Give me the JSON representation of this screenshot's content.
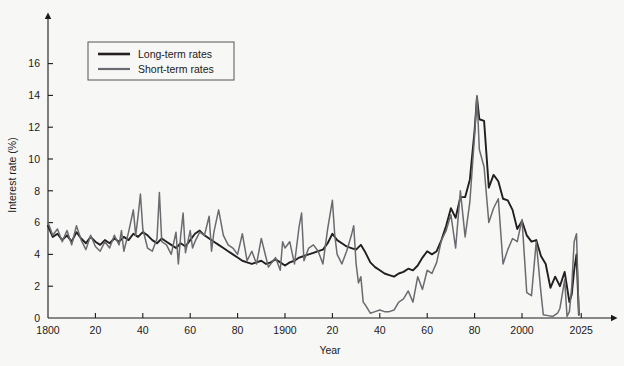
{
  "chart_data": {
    "type": "line",
    "title": "",
    "xlabel": "Year",
    "ylabel": "Interest rate (%)",
    "xlim": [
      1800,
      2025
    ],
    "ylim": [
      0,
      17
    ],
    "grid": false,
    "legend_position": "top-left",
    "y_ticks": [
      0,
      2,
      4,
      6,
      8,
      10,
      12,
      14,
      16
    ],
    "y_tick_labels": [
      "0",
      "2",
      "4",
      "6",
      "8",
      "10",
      "12",
      "14",
      "16"
    ],
    "x_ticks": [
      1800,
      1820,
      1840,
      1860,
      1880,
      1900,
      1920,
      1940,
      1960,
      1980,
      2000,
      2025
    ],
    "x_tick_labels": [
      "1800",
      "20",
      "40",
      "60",
      "80",
      "1900",
      "20",
      "40",
      "60",
      "80",
      "2000",
      "2025"
    ],
    "series": [
      {
        "name": "Long-term rates",
        "color": "#231f20",
        "x": [
          1800,
          1802,
          1804,
          1806,
          1808,
          1810,
          1812,
          1814,
          1816,
          1818,
          1820,
          1822,
          1824,
          1826,
          1828,
          1830,
          1832,
          1834,
          1836,
          1838,
          1840,
          1842,
          1844,
          1846,
          1848,
          1850,
          1852,
          1854,
          1856,
          1858,
          1860,
          1862,
          1864,
          1866,
          1868,
          1870,
          1872,
          1874,
          1876,
          1878,
          1880,
          1882,
          1884,
          1886,
          1888,
          1890,
          1892,
          1894,
          1896,
          1898,
          1900,
          1902,
          1904,
          1906,
          1908,
          1910,
          1912,
          1914,
          1916,
          1918,
          1920,
          1922,
          1924,
          1926,
          1928,
          1930,
          1932,
          1934,
          1936,
          1938,
          1940,
          1942,
          1944,
          1946,
          1948,
          1950,
          1952,
          1954,
          1956,
          1958,
          1960,
          1962,
          1964,
          1966,
          1968,
          1970,
          1972,
          1974,
          1976,
          1978,
          1980,
          1981,
          1982,
          1984,
          1986,
          1988,
          1990,
          1992,
          1994,
          1996,
          1998,
          2000,
          2002,
          2004,
          2006,
          2008,
          2010,
          2012,
          2014,
          2016,
          2018,
          2020,
          2021,
          2022,
          2023,
          2024
        ],
        "y": [
          5.8,
          5.1,
          5.3,
          4.9,
          5.2,
          4.8,
          5.4,
          5.0,
          4.7,
          5.1,
          4.8,
          4.6,
          4.9,
          4.7,
          5.0,
          4.8,
          5.1,
          4.9,
          5.3,
          5.1,
          5.4,
          5.2,
          4.9,
          4.7,
          5.0,
          4.8,
          4.6,
          4.4,
          4.7,
          4.5,
          4.9,
          5.3,
          5.5,
          5.2,
          5.0,
          4.8,
          4.6,
          4.4,
          4.2,
          4.0,
          3.8,
          3.6,
          3.5,
          3.4,
          3.5,
          3.6,
          3.4,
          3.5,
          3.7,
          3.5,
          3.3,
          3.5,
          3.6,
          3.8,
          3.9,
          4.0,
          4.1,
          4.2,
          4.3,
          4.7,
          5.3,
          4.9,
          4.7,
          4.5,
          4.4,
          4.3,
          4.6,
          4.1,
          3.5,
          3.2,
          3.0,
          2.8,
          2.7,
          2.6,
          2.8,
          2.9,
          3.1,
          3.0,
          3.3,
          3.8,
          4.2,
          4.0,
          4.2,
          4.9,
          5.8,
          6.9,
          6.3,
          7.6,
          7.6,
          8.7,
          11.8,
          13.9,
          12.5,
          12.4,
          8.2,
          9.0,
          8.6,
          7.5,
          7.4,
          6.8,
          5.6,
          6.1,
          5.2,
          4.8,
          4.9,
          3.9,
          3.4,
          1.9,
          2.6,
          2.0,
          2.9,
          1.0,
          1.5,
          3.0,
          4.0,
          0.2
        ]
      },
      {
        "name": "Short-term rates",
        "color": "#6b6a6f",
        "x": [
          1800,
          1802,
          1804,
          1806,
          1808,
          1810,
          1812,
          1814,
          1816,
          1818,
          1820,
          1822,
          1824,
          1826,
          1828,
          1830,
          1831,
          1832,
          1834,
          1836,
          1837,
          1838,
          1839,
          1840,
          1842,
          1844,
          1846,
          1847,
          1848,
          1850,
          1852,
          1854,
          1855,
          1856,
          1857,
          1858,
          1860,
          1861,
          1862,
          1864,
          1866,
          1868,
          1869,
          1870,
          1872,
          1873,
          1874,
          1876,
          1878,
          1880,
          1882,
          1884,
          1886,
          1888,
          1890,
          1893,
          1896,
          1898,
          1899,
          1900,
          1902,
          1904,
          1906,
          1907,
          1908,
          1910,
          1912,
          1914,
          1916,
          1918,
          1920,
          1921,
          1922,
          1924,
          1926,
          1928,
          1929,
          1930,
          1931,
          1932,
          1933,
          1934,
          1936,
          1938,
          1940,
          1942,
          1944,
          1946,
          1948,
          1950,
          1952,
          1954,
          1956,
          1958,
          1960,
          1962,
          1964,
          1966,
          1968,
          1970,
          1972,
          1974,
          1976,
          1978,
          1980,
          1981,
          1982,
          1984,
          1986,
          1988,
          1990,
          1992,
          1994,
          1996,
          1998,
          2000,
          2002,
          2004,
          2006,
          2008,
          2009,
          2011,
          2013,
          2015,
          2016,
          2018,
          2019,
          2020,
          2021,
          2022,
          2023,
          2024
        ],
        "y": [
          6.0,
          5.2,
          5.6,
          4.8,
          5.5,
          4.6,
          5.8,
          4.9,
          4.3,
          5.2,
          4.5,
          4.2,
          4.8,
          4.4,
          5.2,
          4.6,
          5.5,
          4.2,
          5.4,
          6.8,
          5.2,
          6.4,
          7.8,
          5.6,
          4.4,
          4.2,
          5.0,
          7.9,
          4.8,
          4.6,
          4.0,
          5.4,
          3.4,
          5.2,
          6.6,
          4.1,
          5.5,
          4.4,
          4.8,
          5.4,
          5.2,
          6.4,
          4.2,
          5.4,
          6.8,
          6.0,
          5.2,
          4.6,
          4.4,
          4.0,
          5.3,
          3.6,
          4.2,
          3.4,
          5.0,
          3.2,
          3.8,
          3.0,
          4.8,
          4.4,
          4.8,
          3.4,
          5.8,
          6.6,
          3.6,
          4.4,
          4.6,
          4.2,
          3.4,
          5.6,
          7.4,
          5.2,
          4.0,
          3.4,
          4.2,
          5.2,
          5.8,
          3.4,
          2.2,
          2.6,
          1.0,
          0.8,
          0.3,
          0.4,
          0.5,
          0.4,
          0.4,
          0.5,
          1.0,
          1.2,
          1.7,
          1.0,
          2.6,
          1.8,
          3.0,
          2.8,
          3.5,
          4.9,
          5.5,
          6.5,
          4.4,
          8.0,
          5.1,
          7.3,
          11.5,
          14.0,
          10.6,
          9.5,
          6.0,
          6.9,
          7.5,
          3.4,
          4.3,
          5.0,
          4.8,
          6.2,
          1.6,
          1.4,
          4.8,
          1.6,
          0.2,
          0.15,
          0.1,
          0.3,
          0.6,
          2.4,
          0.1,
          0.4,
          2.0,
          4.8,
          5.3,
          0.2
        ]
      }
    ]
  },
  "legend": {
    "items": [
      {
        "label": "Long-term rates",
        "color": "#231f20"
      },
      {
        "label": "Short-term rates",
        "color": "#6b6a6f"
      }
    ]
  },
  "axes": {
    "y_title": "Interest rate (%)",
    "x_title": "Year"
  }
}
